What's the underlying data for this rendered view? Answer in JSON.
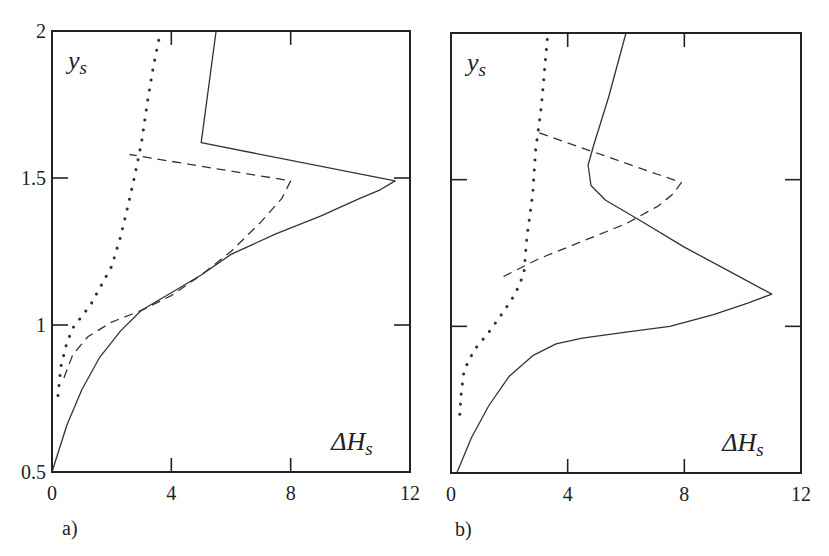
{
  "chart_data": [
    {
      "type": "line",
      "panel_label": "a)",
      "xlabel": "ΔH",
      "xlabel_sub": "s",
      "ylabel": "y",
      "ylabel_sub": "s",
      "xlim": [
        0,
        12
      ],
      "ylim": [
        0.5,
        2
      ],
      "xticks": [
        "0",
        "4",
        "8",
        "12"
      ],
      "yticks": [
        "0.5",
        "1",
        "1.5",
        "2"
      ],
      "grid": false,
      "legend": null,
      "series": [
        {
          "name": "solid",
          "style": "solid",
          "points": [
            [
              0,
              0.5
            ],
            [
              0.5,
              0.66
            ],
            [
              1,
              0.78
            ],
            [
              1.6,
              0.89
            ],
            [
              2.3,
              0.98
            ],
            [
              3,
              1.05
            ],
            [
              4,
              1.11
            ],
            [
              5,
              1.17
            ],
            [
              6,
              1.24
            ],
            [
              7.5,
              1.31
            ],
            [
              9,
              1.37
            ],
            [
              10.3,
              1.43
            ],
            [
              11,
              1.46
            ],
            [
              11.5,
              1.49
            ],
            [
              5,
              1.62
            ],
            [
              5.5,
              2.0
            ]
          ]
        },
        {
          "name": "dashed",
          "style": "dashed",
          "points": [
            [
              0.4,
              0.82
            ],
            [
              0.7,
              0.9
            ],
            [
              1.2,
              0.96
            ],
            [
              2,
              1.01
            ],
            [
              3,
              1.05
            ],
            [
              4,
              1.1
            ],
            [
              5,
              1.17
            ],
            [
              6,
              1.25
            ],
            [
              7,
              1.35
            ],
            [
              7.7,
              1.43
            ],
            [
              8,
              1.49
            ],
            [
              2.6,
              1.58
            ]
          ]
        },
        {
          "name": "dotted",
          "style": "dotted",
          "points": [
            [
              0.2,
              0.76
            ],
            [
              0.3,
              0.86
            ],
            [
              0.5,
              0.94
            ],
            [
              0.7,
              0.99
            ],
            [
              1.3,
              1.07
            ],
            [
              2,
              1.2
            ],
            [
              2.3,
              1.3
            ],
            [
              2.6,
              1.43
            ],
            [
              2.8,
              1.52
            ],
            [
              3.0,
              1.62
            ],
            [
              3.2,
              1.76
            ],
            [
              3.4,
              1.88
            ],
            [
              3.6,
              1.98
            ]
          ]
        }
      ]
    },
    {
      "type": "line",
      "panel_label": "b)",
      "xlabel": "ΔH",
      "xlabel_sub": "s",
      "ylabel": "y",
      "ylabel_sub": "s",
      "xlim": [
        0,
        12
      ],
      "ylim": [
        0.5,
        2
      ],
      "xticks": [
        "0",
        "4",
        "8",
        "12"
      ],
      "yticks": [
        "0.5",
        "1",
        "1.5",
        "2"
      ],
      "grid": false,
      "legend": null,
      "series": [
        {
          "name": "solid",
          "style": "solid",
          "points": [
            [
              0.2,
              0.5
            ],
            [
              0.7,
              0.62
            ],
            [
              1.3,
              0.73
            ],
            [
              2,
              0.83
            ],
            [
              2.8,
              0.9
            ],
            [
              3.6,
              0.94
            ],
            [
              4.5,
              0.96
            ],
            [
              6,
              0.98
            ],
            [
              7.5,
              1.0
            ],
            [
              9,
              1.04
            ],
            [
              10.2,
              1.08
            ],
            [
              11,
              1.11
            ],
            [
              9.5,
              1.19
            ],
            [
              8,
              1.27
            ],
            [
              6.5,
              1.36
            ],
            [
              5.3,
              1.43
            ],
            [
              4.8,
              1.48
            ],
            [
              4.7,
              1.55
            ],
            [
              4.9,
              1.62
            ],
            [
              5.4,
              1.78
            ],
            [
              6,
              2.0
            ]
          ]
        },
        {
          "name": "dashed",
          "style": "dashed",
          "points": [
            [
              1.8,
              1.17
            ],
            [
              3,
              1.23
            ],
            [
              4.5,
              1.29
            ],
            [
              6,
              1.35
            ],
            [
              7.1,
              1.41
            ],
            [
              7.6,
              1.45
            ],
            [
              7.9,
              1.49
            ],
            [
              3,
              1.66
            ]
          ]
        },
        {
          "name": "dotted",
          "style": "dotted",
          "points": [
            [
              0.3,
              0.7
            ],
            [
              0.35,
              0.77
            ],
            [
              0.45,
              0.85
            ],
            [
              0.8,
              0.92
            ],
            [
              1.3,
              0.98
            ],
            [
              1.8,
              1.05
            ],
            [
              2.2,
              1.11
            ],
            [
              2.5,
              1.18
            ],
            [
              2.6,
              1.3
            ],
            [
              2.8,
              1.45
            ],
            [
              2.9,
              1.6
            ],
            [
              3.1,
              1.75
            ],
            [
              3.3,
              1.98
            ]
          ]
        }
      ]
    }
  ]
}
